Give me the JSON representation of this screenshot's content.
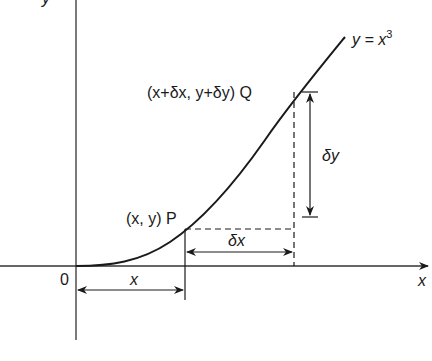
{
  "diagram": {
    "curve_label_prefix": "y = x",
    "curve_label_exp": "3",
    "point_p_label": "(x, y) P",
    "point_q_label": "(x+δx, y+δy) Q",
    "delta_x_label": "δx",
    "delta_y_label": "δy",
    "x_segment_label": "x",
    "origin_label": "0",
    "x_axis_label": "x",
    "y_axis_label": "y",
    "colors": {
      "line": "#1a1a1a",
      "axis": "#333333",
      "background": "#ffffff"
    }
  }
}
